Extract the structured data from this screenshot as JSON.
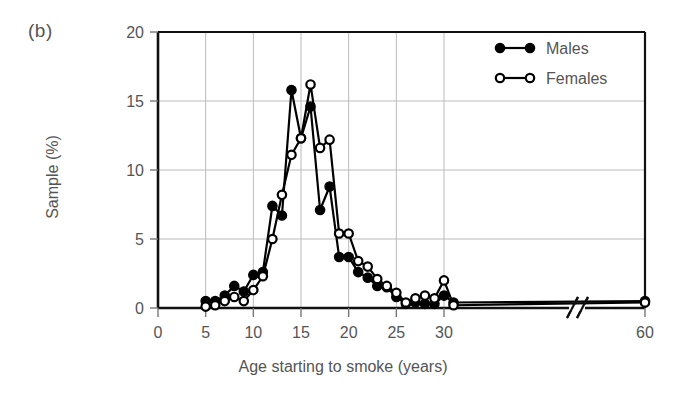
{
  "figure": {
    "panel_label": "(b)",
    "xlabel": "Age starting to smoke (years)",
    "ylabel": "Sample (%)"
  },
  "legend": {
    "position": "top-right",
    "entries": [
      {
        "name": "males-legend",
        "label": "Males",
        "marker": "filled-circle",
        "color": "#000000"
      },
      {
        "name": "females-legend",
        "label": "Females",
        "marker": "open-circle",
        "color": "#000000"
      }
    ]
  },
  "axes": {
    "x_ticks": [
      "0",
      "5",
      "10",
      "15",
      "20",
      "25",
      "30",
      "60"
    ],
    "y_ticks": [
      "0",
      "5",
      "10",
      "15",
      "20"
    ],
    "x_break_after": "30",
    "grid": true
  },
  "chart_data": {
    "type": "line",
    "title": "",
    "subtitle": "",
    "xlabel": "Age starting to smoke (years)",
    "ylabel": "Sample (%)",
    "xlim": [
      0,
      32
    ],
    "ylim": [
      0,
      20
    ],
    "x_tick_values": [
      0,
      5,
      10,
      15,
      20,
      25,
      30,
      60
    ],
    "y_tick_values": [
      0,
      5,
      10,
      15,
      20
    ],
    "axis_break": {
      "after": 30,
      "then": 60
    },
    "grid": true,
    "legend_position": "top-right",
    "x": [
      5,
      6,
      7,
      8,
      9,
      10,
      11,
      12,
      13,
      14,
      15,
      16,
      17,
      18,
      19,
      20,
      21,
      22,
      23,
      24,
      25,
      26,
      27,
      28,
      29,
      30,
      31,
      60
    ],
    "series": [
      {
        "name": "Males",
        "marker": "filled-circle",
        "color": "#000000",
        "values": [
          0.5,
          0.5,
          0.9,
          1.6,
          1.2,
          2.4,
          2.6,
          7.4,
          6.7,
          15.8,
          12.3,
          14.6,
          7.1,
          8.8,
          3.7,
          3.7,
          2.6,
          2.2,
          1.6,
          1.5,
          0.8,
          0.3,
          0.4,
          0.3,
          0.3,
          0.9,
          0.4,
          0.5
        ]
      },
      {
        "name": "Females",
        "marker": "open-circle",
        "color": "#000000",
        "values": [
          0.1,
          0.2,
          0.5,
          0.8,
          0.5,
          1.3,
          2.3,
          5.0,
          8.2,
          11.1,
          12.3,
          16.2,
          11.6,
          12.2,
          5.4,
          5.4,
          3.4,
          3.0,
          2.1,
          1.6,
          1.1,
          0.4,
          0.7,
          0.9,
          0.7,
          2.0,
          0.2,
          0.4
        ]
      }
    ]
  }
}
